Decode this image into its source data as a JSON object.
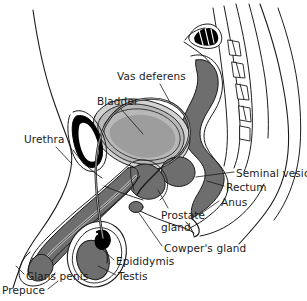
{
  "figure": {
    "view": "mid-sagittal side view",
    "style": "line drawing with grayscale fills"
  },
  "palette": {
    "outline": "#1b1b1b",
    "dark_gray": "#6e6e6e",
    "mid_gray": "#8e8e8e",
    "light_gray": "#b8b8b8",
    "pale_gray": "#d2d2d2",
    "very_pale": "#e4e4e4",
    "black": "#000000",
    "background": "#ffffff",
    "label_text": "#1b1b1b"
  },
  "labels": [
    {
      "id": "vas-deferens",
      "text": "Vas deferens",
      "x": 117,
      "y": 71,
      "lines": 1
    },
    {
      "id": "bladder",
      "text": "Bladder",
      "x": 97,
      "y": 96,
      "lines": 1
    },
    {
      "id": "urethra",
      "text": "Urethra",
      "x": 24,
      "y": 134,
      "lines": 1
    },
    {
      "id": "seminal-vesicle",
      "text": "Seminal vesicle",
      "x": 236,
      "y": 168,
      "lines": 1
    },
    {
      "id": "rectum",
      "text": "Rectum",
      "x": 226,
      "y": 182,
      "lines": 1
    },
    {
      "id": "anus",
      "text": "Anus",
      "x": 221,
      "y": 197,
      "lines": 1
    },
    {
      "id": "prostate-gland",
      "text": "Prostate gland",
      "x": 161,
      "y": 210,
      "lines": 2
    },
    {
      "id": "cowpers-gland",
      "text": "Cowper's gland",
      "x": 164,
      "y": 243,
      "lines": 1
    },
    {
      "id": "epididymis",
      "text": "Epididymis",
      "x": 116,
      "y": 256,
      "lines": 1
    },
    {
      "id": "testis",
      "text": "Testis",
      "x": 118,
      "y": 271,
      "lines": 1
    },
    {
      "id": "glans-penis",
      "text": "Glans penis",
      "x": 26,
      "y": 271,
      "lines": 1
    },
    {
      "id": "prepuce",
      "text": "Prepuce",
      "x": 2,
      "y": 285,
      "lines": 1
    }
  ],
  "structures": [
    "body-contour",
    "spine",
    "sacrum",
    "vertebrae",
    "bladder",
    "pubic-bone",
    "vas-deferens",
    "urethra",
    "penis-shaft",
    "glans-penis",
    "prepuce",
    "scrotum",
    "testis",
    "epididymis",
    "prostate-gland",
    "cowpers-gland",
    "seminal-vesicle",
    "rectum",
    "anus"
  ]
}
